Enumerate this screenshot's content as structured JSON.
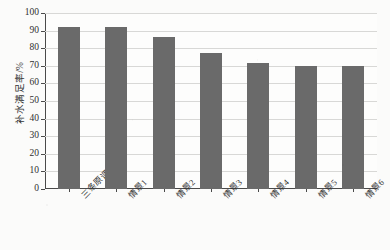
{
  "chart_data": {
    "type": "bar",
    "title": "",
    "subtitle": "",
    "xlabel": "",
    "ylabel": "补水满足率/%",
    "ylim": [
      0,
      100
    ],
    "ytick_step": 10,
    "yticks": [
      0,
      10,
      20,
      30,
      40,
      50,
      60,
      70,
      80,
      90,
      100
    ],
    "ytick_labels": [
      "0",
      "10",
      "20",
      "30",
      "40",
      "50",
      "60",
      "70",
      "80",
      "90",
      "100"
    ],
    "grid": "horizontal",
    "legend": "none",
    "categories": [
      "三条原调度线",
      "情景1",
      "情景2",
      "情景3",
      "情景4",
      "情景5",
      "情景6"
    ],
    "values": [
      92.3,
      92.3,
      86.6,
      77.2,
      71.4,
      69.9,
      69.7
    ],
    "series": [
      {
        "name": "补水满足率",
        "values": [
          92.3,
          92.3,
          86.6,
          77.2,
          71.4,
          69.9,
          69.7
        ]
      }
    ],
    "bar_color": "#6a6a6a",
    "grid_color": "#d8d8d6",
    "axis_color": "#4a4a4a",
    "background_color": "#fdfdfc"
  }
}
